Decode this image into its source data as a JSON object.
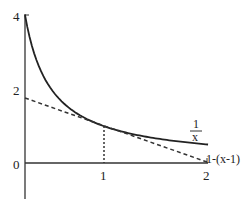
{
  "chart_data": {
    "type": "line",
    "title": "",
    "xlabel": "",
    "ylabel": "",
    "xlim": [
      0,
      2
    ],
    "ylim": [
      -1,
      4
    ],
    "x_ticks": [
      "1",
      "2"
    ],
    "y_ticks": [
      "0",
      "2",
      "4"
    ],
    "grid": false,
    "legend": "none (inline labels)",
    "series": [
      {
        "name": "1/x",
        "label_numerator": "1",
        "label_denominator": "x",
        "style": "solid",
        "x": [
          0.25,
          0.5,
          0.75,
          1.0,
          1.25,
          1.5,
          1.75,
          2.0
        ],
        "y": [
          4.0,
          2.0,
          1.333,
          1.0,
          0.8,
          0.667,
          0.571,
          0.5
        ]
      },
      {
        "name": "1-(x-1)",
        "label": "1-(x-1)",
        "style": "dashed",
        "x": [
          0.25,
          2.0
        ],
        "y": [
          1.75,
          0.0
        ]
      }
    ],
    "annotations": [
      {
        "type": "vertical-dotted-line",
        "x": 1,
        "from_y": 0,
        "to_y": 1
      }
    ]
  },
  "axes": {
    "y_tick_labels": {
      "four": "4",
      "two": "2",
      "zero": "0"
    },
    "x_tick_labels": {
      "one": "1",
      "two": "2"
    }
  },
  "labels": {
    "curve_num": "1",
    "curve_den": "x",
    "tangent": "1-(x-1)"
  },
  "colors": {
    "stroke": "#222222",
    "background": "#ffffff"
  }
}
